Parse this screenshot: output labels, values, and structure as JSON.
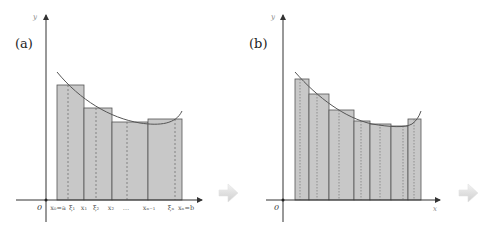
{
  "panel_a": {
    "label": "(a)",
    "y_axis_label": "y",
    "x_axis_label": "x",
    "origin_label": "0",
    "tick_labels": [
      "x₀=a",
      "ξ₁",
      "x₁",
      "ξ₂",
      "x₂",
      "…",
      "xₙ₋₁",
      "ξₙ",
      "xₙ=b"
    ]
  },
  "panel_b": {
    "label": "(b)",
    "y_axis_label": "y",
    "x_axis_label": "x",
    "origin_label": "0"
  },
  "arrows": [
    "right-arrow",
    "right-arrow"
  ],
  "colors": {
    "bar_fill": "#c8c8c8",
    "bar_stroke": "#555555",
    "curve": "#555555",
    "axis": "#333333",
    "arrow": "#d8d8d8"
  }
}
